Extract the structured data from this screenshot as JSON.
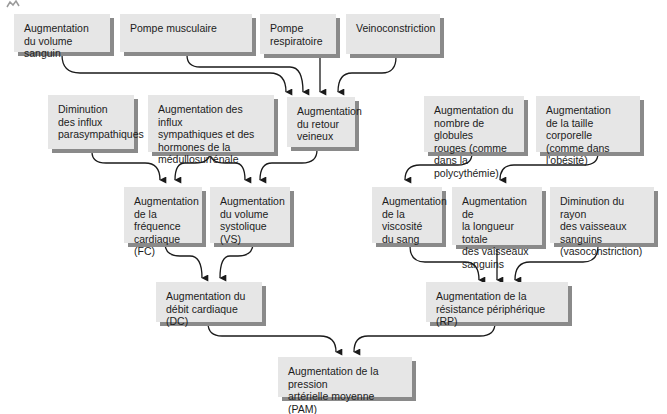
{
  "diagram": {
    "type": "flowchart",
    "boxes": {
      "volume_sanguin": "Augmentation\ndu volume sanguin",
      "pompe_musculaire": "Pompe musculaire",
      "pompe_respiratoire": "Pompe\nrespiratoire",
      "veinoconstriction": "Veinoconstriction",
      "diminution_parasympathiques": "Diminution\ndes influx\nparasympathiques",
      "influx_sympathiques": "Augmentation des influx\nsympathiques et des\nhormones de la\nmédullosurrénale",
      "retour_veineux": "Augmentation\ndu retour\nveineux",
      "globules_rouges": "Augmentation du\nnombre de globules\nrouges (comme\ndans la polycythémie)",
      "taille_corporelle": "Augmentation\nde la taille corporelle\n(comme dans\nl'obésité)",
      "frequence_cardiaque": "Augmentation\nde la fréquence\ncardiaque (FC)",
      "volume_systolique": "Augmentation\ndu volume\nsystolique (VS)",
      "viscosite": "Augmentation\nde la viscosité\ndu sang",
      "longueur_vaisseaux": "Augmentation de\nla longueur totale\ndes vaisseaux\nsanguins",
      "rayon_vaisseaux": "Diminution du rayon\ndes vaisseaux\nsanguins\n(vasoconstriction)",
      "debit_cardiaque": "Augmentation du\ndébit cardiaque (DC)",
      "resistance_peripherique": "Augmentation de la\nrésistance périphérique (RP)",
      "pression_arterielle": "Augmentation de la pression\nartérielle moyenne (PAM)"
    },
    "edges": [
      [
        "volume_sanguin",
        "retour_veineux"
      ],
      [
        "pompe_musculaire",
        "retour_veineux"
      ],
      [
        "pompe_respiratoire",
        "retour_veineux"
      ],
      [
        "veinoconstriction",
        "retour_veineux"
      ],
      [
        "diminution_parasympathiques",
        "frequence_cardiaque"
      ],
      [
        "influx_sympathiques",
        "frequence_cardiaque"
      ],
      [
        "influx_sympathiques",
        "volume_systolique"
      ],
      [
        "retour_veineux",
        "volume_systolique"
      ],
      [
        "globules_rouges",
        "viscosite"
      ],
      [
        "taille_corporelle",
        "longueur_vaisseaux"
      ],
      [
        "frequence_cardiaque",
        "debit_cardiaque"
      ],
      [
        "volume_systolique",
        "debit_cardiaque"
      ],
      [
        "viscosite",
        "resistance_peripherique"
      ],
      [
        "longueur_vaisseaux",
        "resistance_peripherique"
      ],
      [
        "rayon_vaisseaux",
        "resistance_peripherique"
      ],
      [
        "debit_cardiaque",
        "pression_arterielle"
      ],
      [
        "resistance_peripherique",
        "pression_arterielle"
      ]
    ]
  },
  "colors": {
    "box_fill": "#e6e6e6",
    "box_shadow": "#8a8a8a",
    "arrow": "#1a1a1a",
    "text": "#1c1c1c"
  }
}
